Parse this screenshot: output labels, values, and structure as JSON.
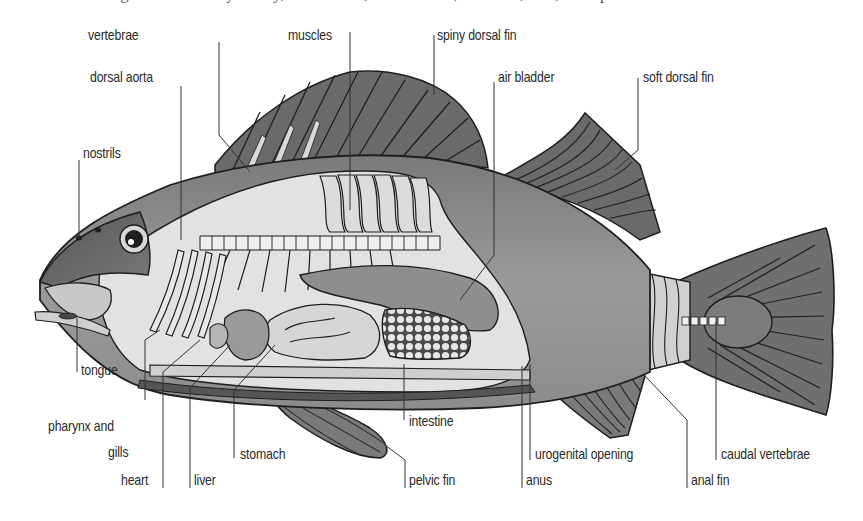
{
  "diagram": {
    "clipped_caption": "… the organs of the body cavity, the viscera; the muscles, skeleton, fins, and spine.",
    "colors": {
      "background": "#ffffff",
      "outline": "#1e1e1e",
      "fin_dark": "#6b6b6b",
      "body_mid": "#8a8a8a",
      "body_light": "#d6d6d6",
      "pale": "#ececec",
      "label_text": "#2a2a2a",
      "leader_line": "#333333"
    }
  },
  "labels": {
    "vertebrae": "vertebrae",
    "muscles": "muscles",
    "spiny_dorsal_fin": "spiny dorsal fin",
    "dorsal_aorta": "dorsal aorta",
    "air_bladder": "air bladder",
    "soft_dorsal_fin": "soft dorsal fin",
    "nostrils": "nostrils",
    "tongue": "tongue",
    "pharynx_and_gills_line1": "pharynx and",
    "pharynx_and_gills_line2": "gills",
    "heart": "heart",
    "liver": "liver",
    "stomach": "stomach",
    "intestine": "intestine",
    "pelvic_fin": "pelvic fin",
    "urogenital_opening": "urogenital opening",
    "anus": "anus",
    "anal_fin": "anal fin",
    "caudal_vertebrae": "caudal vertebrae"
  }
}
